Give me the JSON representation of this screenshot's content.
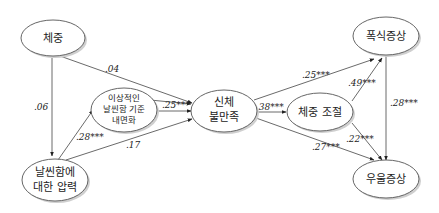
{
  "diagram": {
    "type": "path-model",
    "nodes": [
      {
        "id": "weight",
        "label": [
          "체중"
        ]
      },
      {
        "id": "pressure",
        "label": [
          "날씬함에",
          "대한 압력"
        ]
      },
      {
        "id": "internalization",
        "label": [
          "이상적인",
          "날씬함 기준",
          "내면화"
        ]
      },
      {
        "id": "body_dissatisfaction",
        "label": [
          "신체",
          "불만족"
        ]
      },
      {
        "id": "weight_control",
        "label": [
          "체중 조절"
        ]
      },
      {
        "id": "bulimia",
        "label": [
          "폭식증상"
        ]
      },
      {
        "id": "depression",
        "label": [
          "우울증상"
        ]
      }
    ],
    "edges": [
      {
        "from": "weight",
        "to": "body_dissatisfaction",
        "coef": ".04"
      },
      {
        "from": "weight",
        "to": "pressure",
        "coef": ".06"
      },
      {
        "from": "pressure",
        "to": "internalization",
        "coef": ".28***"
      },
      {
        "from": "pressure",
        "to": "body_dissatisfaction",
        "coef": ".17"
      },
      {
        "from": "internalization",
        "to": "body_dissatisfaction",
        "coef": ".25***"
      },
      {
        "from": "body_dissatisfaction",
        "to": "weight_control",
        "coef": ".38***"
      },
      {
        "from": "body_dissatisfaction",
        "to": "bulimia",
        "coef": ".25***"
      },
      {
        "from": "body_dissatisfaction",
        "to": "depression",
        "coef": ".27***"
      },
      {
        "from": "weight_control",
        "to": "bulimia",
        "coef": ".49***"
      },
      {
        "from": "weight_control",
        "to": "depression",
        "coef": ".22***"
      },
      {
        "from": "bulimia",
        "to": "depression",
        "coef": ".28***"
      }
    ]
  }
}
